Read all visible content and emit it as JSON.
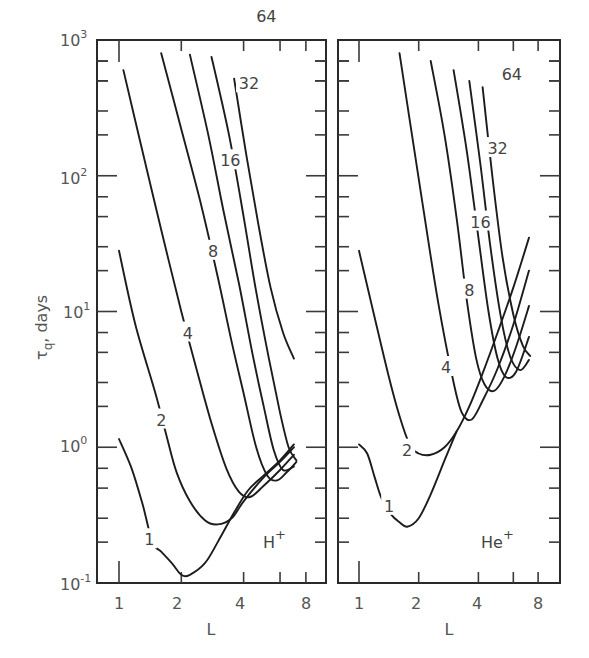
{
  "chart_data": [
    {
      "type": "line",
      "panel": "left",
      "title": "",
      "annotation": "H+",
      "xlabel": "L",
      "ylabel": "τq , days",
      "xscale": "log",
      "yscale": "log",
      "xlim": [
        0.8,
        9.5
      ],
      "ylim": [
        0.1,
        1000
      ],
      "xticks": [
        "1",
        "2",
        "4",
        "8"
      ],
      "yticks": [
        "10^-1",
        "10^0",
        "10^1",
        "10^2",
        "10^3"
      ],
      "grid": false,
      "series": [
        {
          "name": "1",
          "x": [
            1.0,
            1.15,
            1.3,
            1.45,
            1.6,
            1.8,
            2.0,
            2.2,
            2.6,
            3.0,
            3.6,
            4.2,
            5.0,
            6.0,
            7.0
          ],
          "y": [
            1.15,
            0.7,
            0.38,
            0.2,
            0.17,
            0.14,
            0.115,
            0.115,
            0.14,
            0.2,
            0.33,
            0.48,
            0.62,
            0.8,
            1.05
          ]
        },
        {
          "name": "2",
          "x": [
            1.0,
            1.2,
            1.5,
            1.7,
            1.9,
            2.2,
            2.6,
            3.0,
            3.5,
            4.0,
            5.0,
            6.0,
            7.0
          ],
          "y": [
            28,
            8,
            2.5,
            1.2,
            0.65,
            0.4,
            0.29,
            0.27,
            0.3,
            0.4,
            0.6,
            0.78,
            1.0
          ]
        },
        {
          "name": "4",
          "x": [
            1.05,
            1.3,
            1.6,
            2.0,
            2.4,
            2.8,
            3.3,
            3.8,
            4.3,
            5.0,
            6.0,
            7.0
          ],
          "y": [
            600,
            150,
            40,
            10,
            3.5,
            1.5,
            0.7,
            0.47,
            0.43,
            0.52,
            0.68,
            0.88
          ]
        },
        {
          "name": "8",
          "x": [
            1.6,
            2.0,
            2.5,
            3.0,
            3.5,
            4.0,
            4.6,
            5.2,
            5.8,
            6.5,
            7.2
          ],
          "y": [
            800,
            220,
            60,
            18,
            6,
            2.5,
            1.0,
            0.62,
            0.57,
            0.66,
            0.78
          ]
        },
        {
          "name": "16",
          "x": [
            2.2,
            2.7,
            3.2,
            3.8,
            4.4,
            5.0,
            5.6,
            6.2,
            7.0
          ],
          "y": [
            780,
            200,
            55,
            16,
            5,
            2.0,
            0.95,
            0.68,
            0.72
          ]
        },
        {
          "name": "32",
          "x": [
            2.8,
            3.4,
            4.0,
            4.6,
            5.3,
            6.0,
            6.6,
            7.2
          ],
          "y": [
            750,
            200,
            50,
            14,
            4.5,
            1.8,
            1.0,
            0.8
          ]
        },
        {
          "name": "64",
          "x": [
            3.6,
            4.1,
            4.7,
            5.4,
            6.2,
            7.0
          ],
          "y": [
            520,
            150,
            45,
            15,
            7,
            4.5
          ]
        }
      ],
      "curve_label_positions": [
        {
          "name": "1",
          "x": 1.4,
          "y": 0.21
        },
        {
          "name": "2",
          "x": 1.6,
          "y": 1.6
        },
        {
          "name": "4",
          "x": 2.15,
          "y": 7
        },
        {
          "name": "8",
          "x": 2.85,
          "y": 28
        },
        {
          "name": "16",
          "x": 3.45,
          "y": 130
        },
        {
          "name": "32",
          "x": 4.25,
          "y": 480
        },
        {
          "name": "64",
          "x": 5.15,
          "y": 1500
        }
      ]
    },
    {
      "type": "line",
      "panel": "right",
      "title": "",
      "annotation": "He+",
      "xlabel": "L",
      "ylabel": "τq , days",
      "xscale": "log",
      "yscale": "log",
      "xlim": [
        0.8,
        9.5
      ],
      "ylim": [
        0.1,
        1000
      ],
      "xticks": [
        "1",
        "2",
        "4",
        "8"
      ],
      "yticks": [
        "10^-1",
        "10^0",
        "10^1",
        "10^2",
        "10^3"
      ],
      "grid": false,
      "series": [
        {
          "name": "1",
          "x": [
            1.0,
            1.1,
            1.2,
            1.3,
            1.45,
            1.6,
            1.75,
            2.0,
            2.3,
            2.7,
            3.1
          ],
          "y": [
            1.05,
            0.9,
            0.6,
            0.42,
            0.32,
            0.28,
            0.26,
            0.3,
            0.45,
            0.8,
            1.3
          ]
        },
        {
          "name": "2",
          "x": [
            1.0,
            1.2,
            1.4,
            1.6,
            1.8,
            2.0,
            2.3,
            2.7,
            3.1,
            3.6,
            4.2,
            5.0,
            6.0,
            7.2
          ],
          "y": [
            28,
            9,
            3.5,
            1.7,
            1.05,
            0.9,
            0.88,
            1.0,
            1.3,
            2.0,
            3.5,
            7,
            15,
            35
          ]
        },
        {
          "name": "4",
          "x": [
            1.6,
            1.8,
            2.1,
            2.5,
            3.0,
            3.3,
            3.7,
            4.2,
            5.0,
            6.0,
            7.2
          ],
          "y": [
            800,
            260,
            60,
            12,
            3.0,
            1.8,
            1.6,
            2.2,
            3.8,
            8,
            20
          ]
        },
        {
          "name": "8",
          "x": [
            2.3,
            2.7,
            3.1,
            3.5,
            3.9,
            4.3,
            4.8,
            5.4,
            6.2,
            7.2
          ],
          "y": [
            700,
            200,
            50,
            12,
            4.5,
            2.9,
            2.6,
            3.3,
            5.5,
            11
          ]
        },
        {
          "name": "16",
          "x": [
            3.0,
            3.5,
            4.0,
            4.5,
            5.0,
            5.5,
            6.2,
            7.2
          ],
          "y": [
            600,
            150,
            35,
            10,
            4.5,
            3.3,
            3.6,
            6.5
          ]
        },
        {
          "name": "32",
          "x": [
            3.6,
            4.1,
            4.6,
            5.2,
            5.8,
            6.5,
            7.2
          ],
          "y": [
            500,
            120,
            30,
            9,
            4.6,
            3.7,
            4.4
          ]
        },
        {
          "name": "64",
          "x": [
            4.2,
            4.7,
            5.3,
            6.0,
            6.7,
            7.3
          ],
          "y": [
            450,
            100,
            25,
            9.5,
            5.6,
            4.7
          ]
        }
      ],
      "curve_label_positions": [
        {
          "name": "1",
          "x": 1.42,
          "y": 0.37
        },
        {
          "name": "2",
          "x": 1.75,
          "y": 0.96
        },
        {
          "name": "4",
          "x": 2.75,
          "y": 3.9
        },
        {
          "name": "8",
          "x": 3.6,
          "y": 14.5
        },
        {
          "name": "16",
          "x": 4.1,
          "y": 46
        },
        {
          "name": "32",
          "x": 5.0,
          "y": 160
        },
        {
          "name": "64",
          "x": 5.9,
          "y": 560
        }
      ]
    }
  ],
  "figure": {
    "y_axis_label_main": "τ",
    "y_axis_label_sub": "q",
    "y_axis_label_unit": ",  days",
    "x_axis_label": "L",
    "ytick_labels": [
      {
        "base": "10",
        "exp": "3"
      },
      {
        "base": "10",
        "exp": "2"
      },
      {
        "base": "10",
        "exp": "1"
      },
      {
        "base": "10",
        "exp": "0"
      },
      {
        "base": "10",
        "exp": "-1"
      }
    ],
    "xtick_labels": [
      "1",
      "2",
      "4",
      "8"
    ],
    "panel_left_label": {
      "base": "H",
      "sup": "+"
    },
    "panel_right_label": {
      "base": "He",
      "sup": "+"
    },
    "curve_labels": [
      "1",
      "2",
      "4",
      "8",
      "16",
      "32",
      "64"
    ]
  }
}
